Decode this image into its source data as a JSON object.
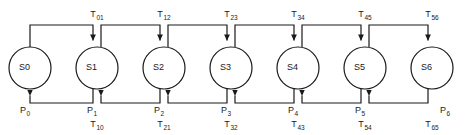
{
  "diagram": {
    "type": "state-transition-chain",
    "stroke_color": "#1a1a1a",
    "background_color": "#ffffff",
    "node_fill": "#ffffff",
    "states": [
      {
        "id": "S0",
        "base": "S",
        "sub": "0",
        "cx": 30,
        "cy": 68,
        "r": 21
      },
      {
        "id": "S1",
        "base": "S",
        "sub": "1",
        "cx": 97,
        "cy": 68,
        "r": 21
      },
      {
        "id": "S2",
        "base": "S",
        "sub": "2",
        "cx": 164,
        "cy": 68,
        "r": 21
      },
      {
        "id": "S3",
        "base": "S",
        "sub": "3",
        "cx": 231,
        "cy": 68,
        "r": 21
      },
      {
        "id": "S4",
        "base": "S",
        "sub": "4",
        "cx": 298,
        "cy": 68,
        "r": 21
      },
      {
        "id": "S5",
        "base": "S",
        "sub": "5",
        "cx": 365,
        "cy": 68,
        "r": 21
      },
      {
        "id": "S6",
        "base": "S",
        "sub": "6",
        "cx": 432,
        "cy": 68,
        "r": 21
      }
    ],
    "forward_transitions": [
      {
        "id": "T01",
        "base": "T",
        "sub": "01",
        "x": 97,
        "y": 10
      },
      {
        "id": "T12",
        "base": "T",
        "sub": "12",
        "x": 164,
        "y": 10
      },
      {
        "id": "T23",
        "base": "T",
        "sub": "23",
        "x": 231,
        "y": 10
      },
      {
        "id": "T34",
        "base": "T",
        "sub": "34",
        "x": 298,
        "y": 10
      },
      {
        "id": "T45",
        "base": "T",
        "sub": "45",
        "x": 365,
        "y": 10
      },
      {
        "id": "T56",
        "base": "T",
        "sub": "56",
        "x": 432,
        "y": 10
      }
    ],
    "backward_transitions": [
      {
        "id": "T10",
        "base": "T",
        "sub": "10",
        "x": 97,
        "y": 120
      },
      {
        "id": "T21",
        "base": "T",
        "sub": "21",
        "x": 164,
        "y": 120
      },
      {
        "id": "T32",
        "base": "T",
        "sub": "32",
        "x": 231,
        "y": 120
      },
      {
        "id": "T43",
        "base": "T",
        "sub": "43",
        "x": 298,
        "y": 120
      },
      {
        "id": "T54",
        "base": "T",
        "sub": "54",
        "x": 365,
        "y": 120
      },
      {
        "id": "T65",
        "base": "T",
        "sub": "65",
        "x": 432,
        "y": 120
      }
    ],
    "probabilities": [
      {
        "id": "P0",
        "base": "P",
        "sub": "0",
        "x": 20,
        "y": 106
      },
      {
        "id": "P1",
        "base": "P",
        "sub": "1",
        "x": 87,
        "y": 106
      },
      {
        "id": "P2",
        "base": "P",
        "sub": "2",
        "x": 154,
        "y": 106
      },
      {
        "id": "P3",
        "base": "P",
        "sub": "3",
        "x": 221,
        "y": 106
      },
      {
        "id": "P4",
        "base": "P",
        "sub": "4",
        "x": 288,
        "y": 106
      },
      {
        "id": "P5",
        "base": "P",
        "sub": "5",
        "x": 355,
        "y": 106
      },
      {
        "id": "P6",
        "base": "P",
        "sub": "6",
        "x": 440,
        "y": 106
      }
    ],
    "geometry": {
      "top_rail_y": 25,
      "bottom_rail_y": 103,
      "stub_offset": 4,
      "stroke_width": 1.2
    }
  }
}
